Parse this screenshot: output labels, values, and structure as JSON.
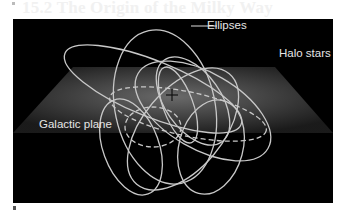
{
  "page": {
    "ghost_title": "15.2 The Origin of the Milky Way"
  },
  "figure": {
    "labels": {
      "ellipses": "Ellipses",
      "halo_stars": "Halo stars",
      "galactic_plane": "Galactic plane"
    },
    "colors": {
      "background": "#000000",
      "orbit_stroke": "#c8c8c8",
      "label_text": "#e6e6e6",
      "plane_center": "#6a6a6a",
      "plane_edge": "#1e1e1e"
    },
    "center_marker": "+"
  }
}
